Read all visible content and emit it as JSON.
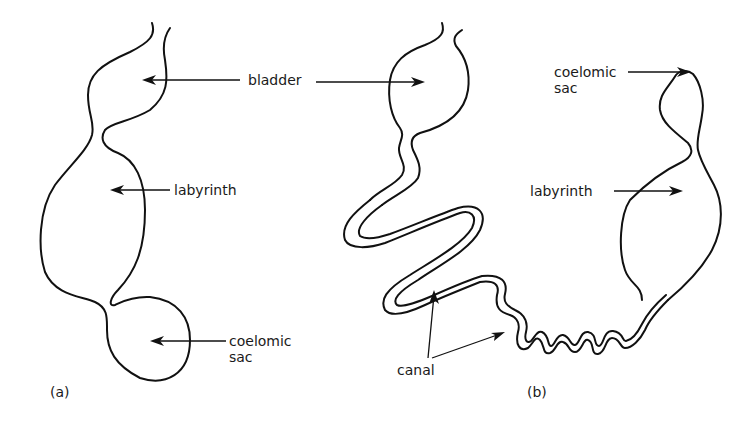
{
  "figure": {
    "panel_a": {
      "tag": "(a)",
      "labels": {
        "bladder": "bladder",
        "labyrinth": "labyrinth",
        "coelomic_sac_line1": "coelomic",
        "coelomic_sac_line2": "sac"
      }
    },
    "panel_b": {
      "tag": "(b)",
      "labels": {
        "coelomic_sac_line1": "coelomic",
        "coelomic_sac_line2": "sac",
        "labyrinth": "labyrinth",
        "canal": "canal"
      }
    },
    "colors": {
      "stroke": "#111111",
      "background": "#ffffff"
    }
  }
}
